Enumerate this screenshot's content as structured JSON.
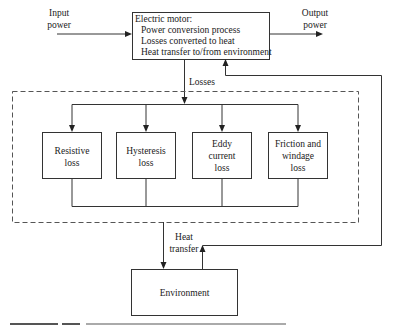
{
  "diagram": {
    "type": "flow-diagram",
    "inputs": {
      "input_power": {
        "line1": "Input",
        "line2": "power"
      },
      "output_power": {
        "line1": "Output",
        "line2": "power"
      }
    },
    "motor": {
      "title": "Electric motor:",
      "lines": [
        "Power conversion process",
        "Losses converted to heat",
        "Heat transfer to/from environment"
      ]
    },
    "losses_label": "Losses",
    "loss_boxes": [
      {
        "lines": [
          "Resistive",
          "loss"
        ]
      },
      {
        "lines": [
          "Hysteresis",
          "loss"
        ]
      },
      {
        "lines": [
          "Eddy",
          "current",
          "loss"
        ]
      },
      {
        "lines": [
          "Friction and",
          "windage",
          "loss"
        ]
      }
    ],
    "heat_transfer_label": {
      "line1": "Heat",
      "line2": "transfer"
    },
    "environment": {
      "label": "Environment"
    },
    "colors": {
      "stroke": "#333333",
      "dashed": "#555555",
      "text": "#1a1a1a",
      "background": "#ffffff"
    }
  }
}
